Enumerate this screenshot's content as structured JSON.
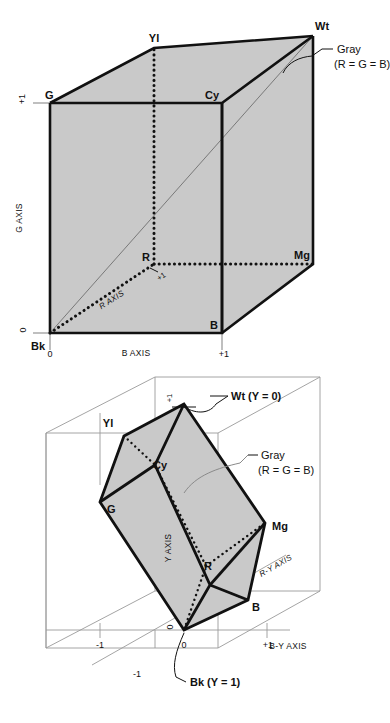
{
  "figure": {
    "colors": {
      "face_fill": "#c9c9c9",
      "face_fill_light": "#d4d4d4",
      "edge_stroke": "#111111",
      "thin_stroke": "#8a8a8a",
      "background": "#ffffff"
    }
  },
  "top_diagram": {
    "name": "rgb-cube",
    "vertex_labels": {
      "black": "Bk",
      "white": "Wt",
      "green": "G",
      "cyan": "Cy",
      "yellow": "Yl",
      "magenta": "Mg",
      "blue": "B",
      "red": "R"
    },
    "axis_labels": {
      "g_axis": "G AXIS",
      "b_axis": "B  AXIS",
      "r_axis": "R AXIS"
    },
    "ticks": {
      "g_zero": "0",
      "g_one": "+1",
      "b_zero": "0",
      "b_one": "+1",
      "r_one": "+1"
    },
    "callout": {
      "line1": "Gray",
      "line2": "(R = G = B)"
    }
  },
  "bottom_diagram": {
    "name": "ycbcr-colour-solid",
    "vertex_labels": {
      "white": "Wt (Y = 0)",
      "black": "Bk (Y = 1)",
      "green": "G",
      "cyan": "Cy",
      "yellow": "Yl",
      "magenta": "Mg",
      "blue": "B",
      "red": "R"
    },
    "axis_labels": {
      "y_axis": "Y AXIS",
      "ry_axis": "R-Y AXIS",
      "by_axis": "B-Y  AXIS"
    },
    "ticks": {
      "y_one": "+1",
      "origin": "0",
      "origin_left": "0",
      "by_minus_one": "-1",
      "by_plus_one": "+1",
      "ry_minus_one": "-1"
    },
    "callout": {
      "line1": "Gray",
      "line2": "(R = G = B)"
    }
  }
}
